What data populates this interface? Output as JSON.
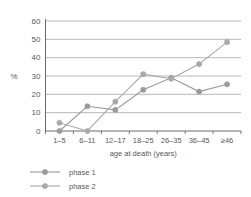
{
  "chart_data": {
    "type": "line",
    "title": "",
    "subtitle": "",
    "xlabel": "age at death (years)",
    "ylabel": "%",
    "categories": [
      "1–5",
      "6–11",
      "12–17",
      "18–25",
      "26–35",
      "36–45",
      "≥46"
    ],
    "yticks": [
      0,
      10,
      20,
      30,
      40,
      50,
      60
    ],
    "ytick_labels": [
      "0",
      "10",
      "20",
      "30",
      "40",
      "50",
      "60"
    ],
    "ylim": [
      0,
      60
    ],
    "grid": true,
    "grid_axis": "y",
    "legend_position": "bottom-left",
    "series": [
      {
        "name": "phase 1",
        "values": [
          0,
          13.5,
          11.5,
          22.5,
          29,
          21.5,
          25.5
        ],
        "color": "#9a9a9a",
        "marker": "circle"
      },
      {
        "name": "phase 2",
        "values": [
          4.5,
          0,
          16,
          31,
          28.5,
          36.5,
          48.5
        ],
        "color": "#a8a8a8",
        "marker": "circle"
      }
    ]
  },
  "legend": {
    "items": [
      {
        "label": "phase 1"
      },
      {
        "label": "phase 2"
      }
    ]
  },
  "colors": {
    "axis": "#6b6b6b",
    "grid": "#a6a6a6",
    "text": "#595959",
    "series_1": "#9a9a9a",
    "series_2": "#a8a8a8",
    "background": "#ffffff"
  }
}
